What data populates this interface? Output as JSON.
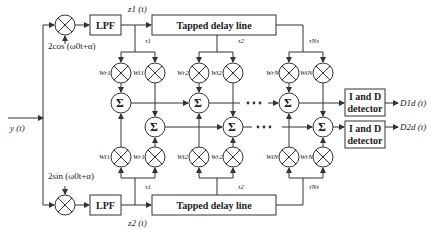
{
  "diagram": {
    "title": "",
    "input": {
      "label": "y (t)"
    },
    "top_branch": {
      "oscillator_label": "2cos (ω0t+α)",
      "lpf_label": "LPF",
      "output_label": "z1 (t)",
      "delay_line_label": "Tapped delay line",
      "taps": [
        "τ1",
        "τ2",
        "τNs"
      ]
    },
    "bottom_branch": {
      "oscillator_label": "2sin (ω0t+α)",
      "lpf_label": "LPF",
      "output_label": "z2 (t)",
      "delay_line_label": "Tapped delay line",
      "taps": [
        "τ1",
        "τ2",
        "τNs"
      ]
    },
    "weights_top": [
      {
        "left": "Wr1",
        "right": "Wi1"
      },
      {
        "left": "Wr2",
        "right": "Wi2"
      },
      {
        "left": "WrN",
        "right": "WiN"
      }
    ],
    "weights_bottom": [
      {
        "left": "Wi1",
        "right": "Wr1"
      },
      {
        "left": "Wi2",
        "right": "Wr2"
      },
      {
        "left": "WiN",
        "right": "WrN"
      }
    ],
    "summer_symbol": "Σ",
    "ellipsis": "• • •",
    "detectors": [
      {
        "label_line1": "I and D",
        "label_line2": "detector",
        "output": "D1d (t)"
      },
      {
        "label_line1": "I and D",
        "label_line2": "detector",
        "output": "D2d (t)"
      }
    ],
    "colors": {
      "stroke": "#333333",
      "background": "#ffffff"
    }
  }
}
